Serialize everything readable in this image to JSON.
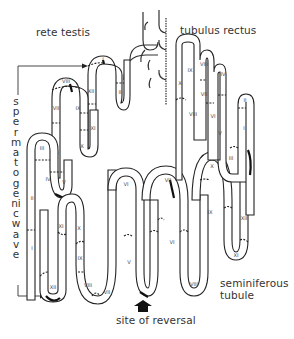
{
  "figure": {
    "type": "diagram",
    "labels": {
      "rete_testis": "rete testis",
      "tubulus_rectus": "tubulus rectus",
      "spermatogenic_wave": "spermatogenic wave",
      "seminiferous_tubule_line1": "seminiferous",
      "seminiferous_tubule_line2": "tubule",
      "site_of_reversal": "site of reversal"
    },
    "stages": {
      "left_loop_1": [
        "I",
        "XII",
        "II"
      ],
      "left_loop_2": [
        "VIII",
        "VII",
        "IX",
        "VI",
        "XI",
        "X"
      ],
      "left_loop_3": [
        "III",
        "IV",
        "V",
        "II",
        "I"
      ],
      "left_bottom_loop": [
        "XI",
        "X",
        "XII",
        "IX",
        "VIII",
        "VII"
      ],
      "middle_loop": [
        "VI",
        "V"
      ],
      "middle_right_loop": [
        "VII",
        "VI",
        "VIII"
      ],
      "right_bottom_loop": [
        "X",
        "IX",
        "XI",
        "XII"
      ],
      "right_top_loops": [
        "X",
        "IX",
        "VIII",
        "VII",
        "VI",
        "V",
        "IV",
        "III",
        "II",
        "I"
      ]
    },
    "colors": {
      "line": "#222222",
      "text": "#333333",
      "background": "#ffffff"
    }
  }
}
